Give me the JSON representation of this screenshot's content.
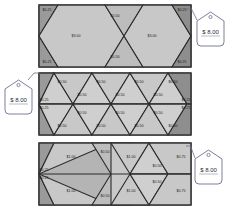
{
  "canvas": {
    "width": 229,
    "height": 213,
    "background": "#ffffff"
  },
  "theme": {
    "panel_fill": "#b4b4b4",
    "cell_light": "#c8c8c8",
    "cell_lighter": "#cfcfcf",
    "cell_mid": "#bdbdbd",
    "cell_dark": "#9a9a9a",
    "cell_darker": "#8e8e8e",
    "stroke": "#2b2b2b",
    "tag_stroke": "#6f6f90",
    "tag_fill": "#ffffff",
    "label_color": "#1b1b1b"
  },
  "panels": [
    {
      "id": "panel-top",
      "name": "top-tiling-panel",
      "x": 39,
      "y": 5,
      "width": 152,
      "height": 62,
      "labels": [
        {
          "text": "$0.25",
          "x": 47,
          "y": 10
        },
        {
          "text": "$0.50",
          "x": 115,
          "y": 16
        },
        {
          "text": "$3.00",
          "x": 76,
          "y": 36
        },
        {
          "text": "$3.00",
          "x": 152,
          "y": 36
        },
        {
          "text": "$0.50",
          "x": 115,
          "y": 57
        },
        {
          "text": "$0.25",
          "x": 47,
          "y": 62
        },
        {
          "text": "$0.25",
          "x": 182,
          "y": 10
        },
        {
          "text": "$0.25",
          "x": 182,
          "y": 62
        }
      ]
    },
    {
      "id": "panel-middle",
      "name": "middle-tiling-panel",
      "x": 39,
      "y": 73,
      "width": 152,
      "height": 62,
      "labels": [
        {
          "text": "$0.50",
          "x": 62,
          "y": 82
        },
        {
          "text": "$0.50",
          "x": 101,
          "y": 82
        },
        {
          "text": "$0.50",
          "x": 139,
          "y": 82
        },
        {
          "text": "$0.50",
          "x": 173,
          "y": 82
        },
        {
          "text": "$0.50",
          "x": 82,
          "y": 95
        },
        {
          "text": "$0.50",
          "x": 120,
          "y": 95
        },
        {
          "text": "$0.50",
          "x": 158,
          "y": 95
        },
        {
          "text": "$0.25",
          "x": 44,
          "y": 100
        },
        {
          "text": "$0.25",
          "x": 186,
          "y": 100
        },
        {
          "text": "$0.25",
          "x": 44,
          "y": 108
        },
        {
          "text": "$0.25",
          "x": 186,
          "y": 108
        },
        {
          "text": "$0.50",
          "x": 82,
          "y": 113
        },
        {
          "text": "$0.50",
          "x": 120,
          "y": 113
        },
        {
          "text": "$0.50",
          "x": 158,
          "y": 113
        },
        {
          "text": "$0.50",
          "x": 62,
          "y": 126
        },
        {
          "text": "$0.50",
          "x": 101,
          "y": 126
        },
        {
          "text": "$0.50",
          "x": 139,
          "y": 126
        },
        {
          "text": "$0.50",
          "x": 173,
          "y": 126
        }
      ]
    },
    {
      "id": "panel-bottom",
      "name": "bottom-tiling-panel",
      "x": 39,
      "y": 143,
      "width": 152,
      "height": 62,
      "labels": [
        {
          "text": "$1.00",
          "x": 71,
          "y": 157
        },
        {
          "text": "$0.50",
          "x": 105,
          "y": 152
        },
        {
          "text": "$1.00",
          "x": 131,
          "y": 157
        },
        {
          "text": "$0.50",
          "x": 157,
          "y": 166
        },
        {
          "text": "$0.75",
          "x": 181,
          "y": 157
        },
        {
          "text": "$0.25",
          "x": 44,
          "y": 170
        },
        {
          "text": "$0.25",
          "x": 44,
          "y": 178
        },
        {
          "text": "$1.00",
          "x": 71,
          "y": 191
        },
        {
          "text": "$0.50",
          "x": 105,
          "y": 196
        },
        {
          "text": "$1.00",
          "x": 131,
          "y": 191
        },
        {
          "text": "$0.50",
          "x": 157,
          "y": 182
        },
        {
          "text": "$0.75",
          "x": 181,
          "y": 191
        }
      ]
    }
  ],
  "tags": [
    {
      "id": "tag-top-right",
      "name": "price-tag-top",
      "text": "$ 8.00",
      "x": 197,
      "y": 12,
      "leader_from": [
        197,
        20
      ],
      "leader_to": [
        186,
        9
      ]
    },
    {
      "id": "tag-middle-left",
      "name": "price-tag-middle",
      "text": "$ 8.00",
      "x": 5,
      "y": 80,
      "leader_from": [
        28,
        80
      ],
      "leader_to": [
        40,
        73
      ]
    },
    {
      "id": "tag-bottom-right",
      "name": "price-tag-bottom",
      "text": "$ 8.00",
      "x": 195,
      "y": 150,
      "leader_from": [
        195,
        158
      ],
      "leader_to": [
        186,
        146
      ]
    }
  ]
}
